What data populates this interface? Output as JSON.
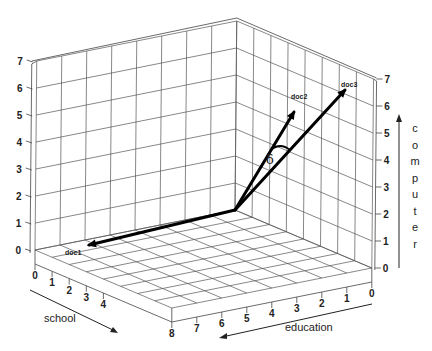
{
  "diagram": {
    "title": "",
    "axes": {
      "school": {
        "label": "school",
        "ticks": [
          "0",
          "1",
          "2",
          "3",
          "4",
          "8"
        ]
      },
      "education": {
        "label": "education",
        "ticks": [
          "0",
          "1",
          "2",
          "3",
          "4",
          "5",
          "6",
          "7",
          "8"
        ]
      },
      "computer": {
        "label": "computer",
        "letters": [
          "c",
          "o",
          "m",
          "p",
          "u",
          "t",
          "e",
          "r"
        ],
        "ticks": [
          "0",
          "1",
          "2",
          "3",
          "4",
          "5",
          "6",
          "7"
        ]
      }
    },
    "vectors": [
      {
        "name": "doc1",
        "label": "doc1",
        "tip_px": [
          89,
          245
        ]
      },
      {
        "name": "doc2",
        "label": "doc2",
        "tip_px": [
          294,
          112
        ]
      },
      {
        "name": "doc3",
        "label": "doc3",
        "tip_px": [
          345,
          90
        ]
      }
    ],
    "angle_label": "δ",
    "colors": {
      "grid": "#555555",
      "vectors": "#000000",
      "background": "#ffffff"
    }
  }
}
